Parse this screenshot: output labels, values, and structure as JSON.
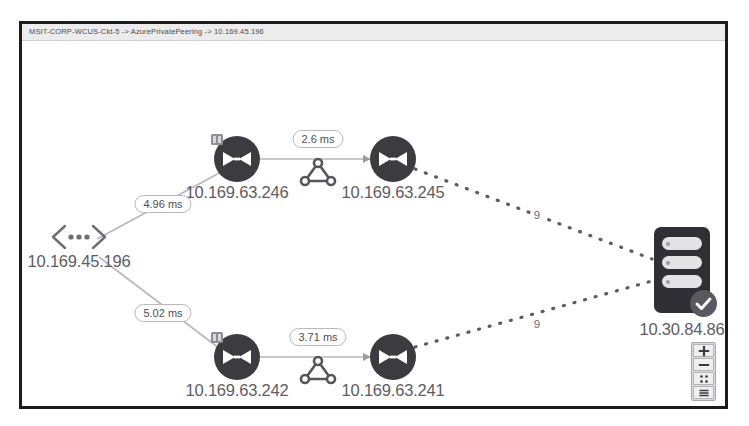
{
  "window": {
    "title": "MSIT-CORP-WCUS-Ckt-5 -> AzurePrivatePeering -> 10.169.45.196"
  },
  "topology": {
    "source": {
      "label": "10.169.45.196",
      "icon": "chevron-dots-icon"
    },
    "destination": {
      "label": "10.30.84.86",
      "icon": "server-icon",
      "status": "healthy"
    },
    "routers": [
      {
        "id": "r246",
        "label": "10.169.63.246",
        "icon": "router-icon"
      },
      {
        "id": "r245",
        "label": "10.169.63.245",
        "icon": "router-icon"
      },
      {
        "id": "r242",
        "label": "10.169.63.242",
        "icon": "router-icon"
      },
      {
        "id": "r241",
        "label": "10.169.63.241",
        "icon": "router-icon"
      }
    ],
    "links": [
      {
        "from": "10.169.45.196",
        "to": "10.169.63.246",
        "latency": "4.96 ms",
        "style": "solid"
      },
      {
        "from": "10.169.63.246",
        "to": "10.169.63.245",
        "latency": "2.6 ms",
        "style": "solid"
      },
      {
        "from": "10.169.45.196",
        "to": "10.169.63.242",
        "latency": "5.02 ms",
        "style": "solid"
      },
      {
        "from": "10.169.63.242",
        "to": "10.169.63.241",
        "latency": "3.71 ms",
        "style": "solid"
      },
      {
        "from": "10.169.63.245",
        "to": "10.30.84.86",
        "hops": "9",
        "style": "dashed"
      },
      {
        "from": "10.169.63.241",
        "to": "10.30.84.86",
        "hops": "9",
        "style": "dashed"
      }
    ]
  },
  "zoom_control": {
    "zoom_in": "+",
    "zoom_out": "−",
    "fit": "fit-to-screen",
    "legend": "legend"
  },
  "colors": {
    "node_dark": "#3b3b40",
    "server_dark": "#2f2f35",
    "label_text": "#5d5d62",
    "edge": "#b3b3b8",
    "frame": "#1c1c1c",
    "title_bar": "#ececed"
  }
}
